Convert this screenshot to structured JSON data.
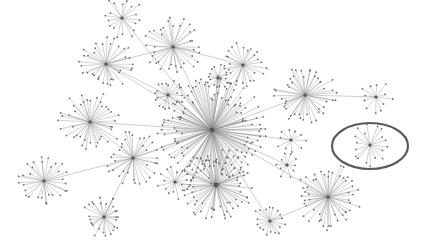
{
  "diagram": {
    "type": "network-graph",
    "width": 422,
    "height": 246,
    "colors": {
      "background": "#ffffff",
      "edge": "#8a8a8a",
      "node": "#6e6e6e",
      "hub": "#555555",
      "highlight_ellipse": "#5a5a5a"
    },
    "hubs": [
      {
        "id": "h-top-small",
        "x": 122,
        "y": 18,
        "r": 22,
        "n": 18
      },
      {
        "id": "h-top-center",
        "x": 173,
        "y": 47,
        "r": 30,
        "n": 36
      },
      {
        "id": "h-left-upper",
        "x": 106,
        "y": 64,
        "r": 28,
        "n": 34
      },
      {
        "id": "h-right-upper",
        "x": 243,
        "y": 65,
        "r": 24,
        "n": 26
      },
      {
        "id": "h-small-mid",
        "x": 218,
        "y": 78,
        "r": 14,
        "n": 16
      },
      {
        "id": "h-small-mid2",
        "x": 168,
        "y": 95,
        "r": 16,
        "n": 20
      },
      {
        "id": "h-left",
        "x": 90,
        "y": 122,
        "r": 32,
        "n": 40
      },
      {
        "id": "h-central",
        "x": 212,
        "y": 130,
        "r": 55,
        "n": 140
      },
      {
        "id": "h-right-big",
        "x": 305,
        "y": 95,
        "r": 32,
        "n": 44
      },
      {
        "id": "h-small-right",
        "x": 376,
        "y": 97,
        "r": 17,
        "n": 12
      },
      {
        "id": "h-circled",
        "x": 370,
        "y": 145,
        "r": 22,
        "n": 18
      },
      {
        "id": "h-left-mid",
        "x": 133,
        "y": 158,
        "r": 28,
        "n": 34
      },
      {
        "id": "h-lower-center",
        "x": 216,
        "y": 185,
        "r": 38,
        "n": 70
      },
      {
        "id": "h-small-left",
        "x": 175,
        "y": 182,
        "r": 18,
        "n": 16
      },
      {
        "id": "h-far-left",
        "x": 44,
        "y": 181,
        "r": 26,
        "n": 30
      },
      {
        "id": "h-bottom-left",
        "x": 104,
        "y": 217,
        "r": 22,
        "n": 28
      },
      {
        "id": "h-bottom-right",
        "x": 328,
        "y": 197,
        "r": 34,
        "n": 50
      },
      {
        "id": "h-small-bottom",
        "x": 270,
        "y": 221,
        "r": 18,
        "n": 18
      },
      {
        "id": "h-right-mid-a",
        "x": 291,
        "y": 140,
        "r": 16,
        "n": 10
      },
      {
        "id": "h-right-mid-b",
        "x": 287,
        "y": 165,
        "r": 13,
        "n": 10
      }
    ],
    "links": [
      [
        "h-top-small",
        "h-central"
      ],
      [
        "h-top-center",
        "h-central"
      ],
      [
        "h-left-upper",
        "h-central"
      ],
      [
        "h-right-upper",
        "h-central"
      ],
      [
        "h-small-mid",
        "h-central"
      ],
      [
        "h-small-mid2",
        "h-central"
      ],
      [
        "h-left",
        "h-central"
      ],
      [
        "h-right-big",
        "h-central"
      ],
      [
        "h-right-big",
        "h-small-right"
      ],
      [
        "h-left-mid",
        "h-central"
      ],
      [
        "h-lower-center",
        "h-central"
      ],
      [
        "h-small-left",
        "h-central"
      ],
      [
        "h-far-left",
        "h-left-mid"
      ],
      [
        "h-bottom-left",
        "h-left-mid"
      ],
      [
        "h-bottom-right",
        "h-central"
      ],
      [
        "h-small-bottom",
        "h-bottom-right"
      ],
      [
        "h-small-bottom",
        "h-central"
      ],
      [
        "h-right-mid-a",
        "h-central"
      ],
      [
        "h-right-mid-b",
        "h-central"
      ],
      [
        "h-top-center",
        "h-left-upper"
      ],
      [
        "h-left-upper",
        "h-small-mid2"
      ],
      [
        "h-top-center",
        "h-right-upper"
      ],
      [
        "h-left",
        "h-left-mid"
      ]
    ],
    "highlight": {
      "label": "isolated-cluster",
      "cx": 370,
      "cy": 146,
      "rx": 38,
      "ry": 23
    }
  }
}
